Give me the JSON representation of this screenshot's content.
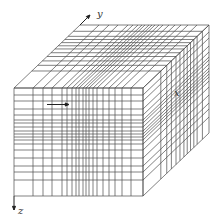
{
  "figure": {
    "axes": {
      "x_label": "x",
      "y_label": "y",
      "z_label": "z"
    },
    "colors": {
      "line": "#4a4a4a",
      "background": "#ffffff",
      "axis": "#222222"
    },
    "geometry": {
      "front_left": 14,
      "front_right": 143,
      "front_top": 88,
      "front_bottom": 196,
      "depth_dx": 66,
      "depth_dy": -63
    },
    "grid": {
      "x_divisions_front": [
        14,
        33,
        43,
        52,
        62,
        67,
        72,
        76,
        79,
        83,
        86,
        89,
        93,
        97,
        103,
        109,
        115,
        122,
        131,
        143
      ],
      "z_divisions_front": [
        88,
        95,
        101,
        109,
        115,
        120,
        123,
        127,
        131,
        134,
        137,
        140,
        144,
        150,
        158,
        166,
        172,
        180,
        196
      ],
      "depth_fractions": [
        0,
        0.27,
        0.36,
        0.43,
        0.5,
        0.56,
        0.62,
        0.67,
        0.72,
        0.77,
        0.82,
        0.9,
        1.0
      ]
    }
  }
}
